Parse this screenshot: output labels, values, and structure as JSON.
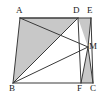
{
  "figure": {
    "background_color": "#ffffff",
    "stroke_color": "#3a3a3a",
    "shade_color": "#c8c8c8",
    "label_color": "#1a1a1a"
  },
  "labels": {
    "A": "A",
    "B": "B",
    "C": "C",
    "D": "D",
    "E": "E",
    "F": "F",
    "M": "M"
  },
  "chart_data": {
    "type": "scatter",
    "xlabel": "",
    "ylabel": "",
    "xlim": [
      0,
      99
    ],
    "ylim": [
      0,
      98
    ],
    "grid": false,
    "legend": "none",
    "points": [
      {
        "name": "A",
        "x": 20,
        "y": 18,
        "label": "A",
        "label_x": 16,
        "label_y": 6
      },
      {
        "name": "B",
        "x": 13,
        "y": 83,
        "label": "B",
        "label_x": 9,
        "label_y": 84
      },
      {
        "name": "C",
        "x": 93,
        "y": 83,
        "label": "C",
        "label_x": 90,
        "label_y": 84
      },
      {
        "name": "D",
        "x": 78,
        "y": 18,
        "label": "D",
        "label_x": 73,
        "label_y": 6
      },
      {
        "name": "E",
        "x": 91,
        "y": 18,
        "label": "E",
        "label_x": 87,
        "label_y": 6
      },
      {
        "name": "F",
        "x": 81,
        "y": 83,
        "label": "F",
        "label_x": 77,
        "label_y": 84
      },
      {
        "name": "M",
        "x": 88,
        "y": 47,
        "label": "M",
        "label_x": 89,
        "label_y": 42
      }
    ],
    "segments": [
      {
        "name": "A-E",
        "from": "A",
        "to": "E"
      },
      {
        "name": "A-B",
        "from": "A",
        "to": "B"
      },
      {
        "name": "B-C",
        "from": "B",
        "to": "C"
      },
      {
        "name": "E-C",
        "from": "E",
        "to": "C"
      },
      {
        "name": "A-D",
        "from": "A",
        "to": "D"
      },
      {
        "name": "B-D",
        "from": "B",
        "to": "D"
      },
      {
        "name": "B-M",
        "from": "B",
        "to": "M"
      },
      {
        "name": "A-M",
        "from": "A",
        "to": "M"
      },
      {
        "name": "D-F",
        "from": "D",
        "to": "F"
      },
      {
        "name": "E-M",
        "from": "E",
        "to": "M"
      },
      {
        "name": "M-F",
        "from": "M",
        "to": "F"
      },
      {
        "name": "M-C",
        "from": "M",
        "to": "C"
      }
    ],
    "shaded_regions": [
      {
        "name": "triangle-ABD",
        "vertices": [
          "A",
          "B",
          "D"
        ]
      },
      {
        "name": "triangle-DEM",
        "vertices": [
          "D",
          "E",
          "M"
        ]
      },
      {
        "name": "triangle-MFC",
        "vertices": [
          "M",
          "F",
          "C"
        ]
      }
    ]
  }
}
